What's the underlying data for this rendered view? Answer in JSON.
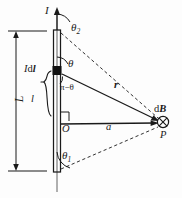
{
  "figure": {
    "background_color": "#fdfdfd",
    "ink_color": "#1a1a1a",
    "width": 182,
    "height": 198
  },
  "labels": {
    "current": "I",
    "theta_2": "θ",
    "theta_2_sub": "2",
    "theta_1": "θ",
    "theta_1_sub": "1",
    "theta": "θ",
    "pi_minus_theta": "π−θ",
    "current_element": "I",
    "current_element_d": "d",
    "current_element_l": "l",
    "segment_l": "l",
    "wire_length": "L",
    "origin": "O",
    "distance_a": "a",
    "radius_r": "r",
    "field_d": "d",
    "field_B": "B",
    "point_P": "P"
  },
  "geometry": {
    "wire_x": 57,
    "wire_top_y": 30,
    "wire_bottom_y": 172,
    "wire_half_width": 3,
    "element_y": 71,
    "origin_y": 124,
    "point_p_x": 163,
    "point_p_y": 122,
    "dim_line_x": 16,
    "dim_top_y": 32,
    "dim_bottom_y": 170
  },
  "elements": {
    "field_symbol": "circle-x-into-page",
    "current_arrow": "arrow-up",
    "brace": "curly-brace-left",
    "right_angle_mark": "square-corner"
  }
}
